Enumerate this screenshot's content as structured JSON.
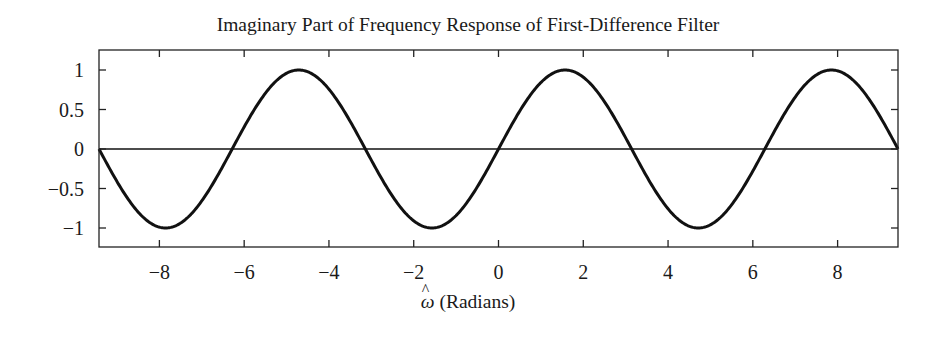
{
  "chart_data": {
    "type": "line",
    "title": "Imaginary Part of Frequency Response of First-Difference Filter",
    "xlabel_symbol": "ω",
    "xlabel_text": "(Radians)",
    "ylabel": "",
    "xlim": [
      -9.4248,
      9.4248
    ],
    "ylim": [
      -1.25,
      1.25
    ],
    "xticks": [
      -8,
      -6,
      -4,
      -2,
      0,
      2,
      4,
      6,
      8
    ],
    "xtick_labels": [
      "−8",
      "−6",
      "−4",
      "−2",
      "0",
      "2",
      "4",
      "6",
      "8"
    ],
    "yticks": [
      1,
      0.5,
      0,
      -0.5,
      -1
    ],
    "ytick_labels": [
      "1",
      "0.5",
      "0",
      "−0.5",
      "−1"
    ],
    "grid": false,
    "legend": null,
    "reference_line": {
      "y": 0
    },
    "series": [
      {
        "name": "Im{H(e^{jω})} = sin(ω)",
        "function": "sin",
        "x": [
          -9.4248,
          -8.6394,
          -7.854,
          -7.0686,
          -6.2832,
          -5.4978,
          -4.7124,
          -3.927,
          -3.1416,
          -2.3562,
          -1.5708,
          -0.7854,
          0,
          0.7854,
          1.5708,
          2.3562,
          3.1416,
          3.927,
          4.7124,
          5.4978,
          6.2832,
          7.0686,
          7.854,
          8.6394,
          9.4248
        ],
        "values": [
          0,
          -0.707,
          -1,
          -0.707,
          0,
          0.707,
          1,
          0.707,
          0,
          -0.707,
          -1,
          -0.707,
          0,
          0.707,
          1,
          0.707,
          0,
          -0.707,
          -1,
          -0.707,
          0,
          0.707,
          1,
          0.707,
          0
        ],
        "color": "#111111"
      }
    ]
  }
}
